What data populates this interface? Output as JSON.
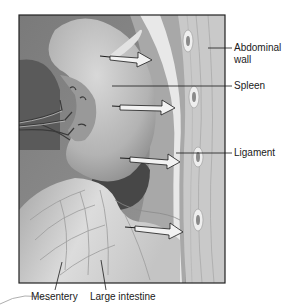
{
  "figure": {
    "labels": {
      "abdominal_wall_line1": "Abdominal",
      "abdominal_wall_line2": "wall",
      "spleen": "Spleen",
      "ligament": "Ligament",
      "mesentery": "Mesentery",
      "large_intestine": "Large intestine"
    },
    "colors": {
      "frame": "#222222",
      "background_cavity": "#8a8a8a",
      "dark_cavity": "#4a4a4a",
      "spleen": "#b9b9b9",
      "spleen_highlight": "#d6d6d6",
      "abdominal_wall": "#c8c8c8",
      "peritoneum_band": "#e6e6e6",
      "nodule": "#eeeeee",
      "arrow_fill": "#f2f2f2",
      "intestine": "#cfcfcf",
      "leader_line": "#1a1a1a"
    }
  }
}
